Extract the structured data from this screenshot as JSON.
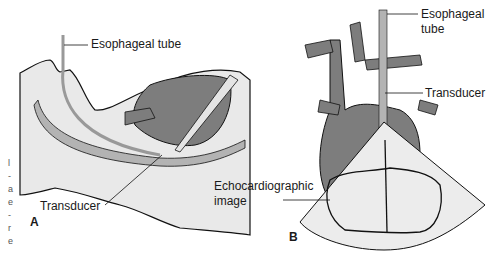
{
  "figure": {
    "panel_a": {
      "letter": "A",
      "labels": {
        "esophageal_tube": "Esophageal tube",
        "transducer": "Transducer"
      }
    },
    "panel_b": {
      "letter": "B",
      "labels": {
        "esophageal_tube_line1": "Esophageal",
        "esophageal_tube_line2": "tube",
        "transducer": "Transducer",
        "echo_line1": "Echocardiographic",
        "echo_line2": "image"
      }
    },
    "margin_fragments": [
      "l",
      "-",
      "a",
      "e",
      "-",
      "r",
      "e"
    ]
  },
  "colors": {
    "skin": "#e9e9e9",
    "organ": "#7d7d7d",
    "tube": "#b3b3b3",
    "sector": "#ececec",
    "outline": "#111111"
  }
}
